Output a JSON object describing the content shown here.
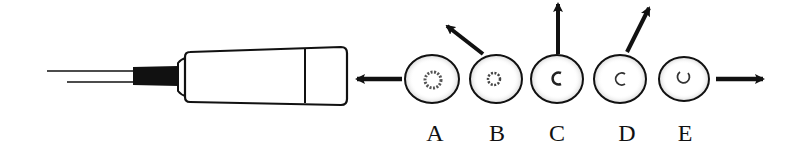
{
  "diagram": {
    "colors": {
      "ink": "#111111",
      "background": "#ffffff",
      "stipple": "#555555"
    },
    "pipette": {
      "name": "micropipette",
      "arrow_direction": "left"
    },
    "cells": [
      {
        "id": "A",
        "label": "A",
        "cx": 432,
        "arrow": "left-into-pipette",
        "nucleus": "ring"
      },
      {
        "id": "B",
        "label": "B",
        "cx": 496,
        "arrow": "up-left",
        "nucleus": "ring"
      },
      {
        "id": "C",
        "label": "C",
        "cx": 557,
        "arrow": "up",
        "nucleus": "crescent"
      },
      {
        "id": "D",
        "label": "D",
        "cx": 620,
        "arrow": "up-right",
        "nucleus": "crescent"
      },
      {
        "id": "E",
        "label": "E",
        "cx": 684,
        "arrow": "right",
        "nucleus": "crescent"
      }
    ]
  }
}
